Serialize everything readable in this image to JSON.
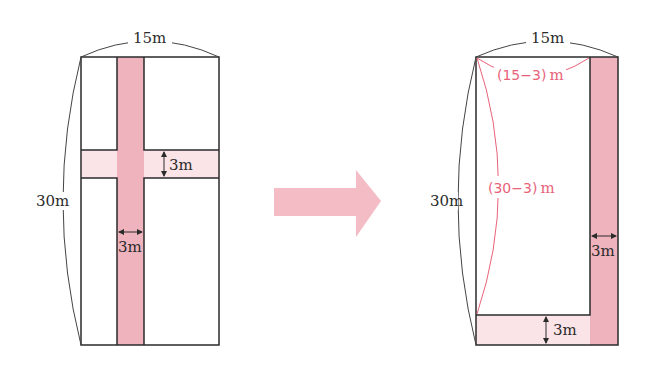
{
  "colors": {
    "path_dark": "#efb3bd",
    "path_light": "#fbe4e8",
    "arrow": "#f4bcc5",
    "outline": "#2b2b2b",
    "annotation": "#e8637a"
  },
  "left_figure": {
    "width_label": "15m",
    "height_label": "30m",
    "horizontal_path_label": "3m",
    "vertical_path_label": "3m"
  },
  "arrow": {
    "icon": "right-arrow-icon"
  },
  "right_figure": {
    "width_label": "15m",
    "height_label": "30m",
    "reduced_width_label": "(15−3)",
    "reduced_width_unit": "m",
    "reduced_height_label": "(30−3)",
    "reduced_height_unit": "m",
    "vertical_path_label": "3m",
    "horizontal_path_label": "3m"
  }
}
